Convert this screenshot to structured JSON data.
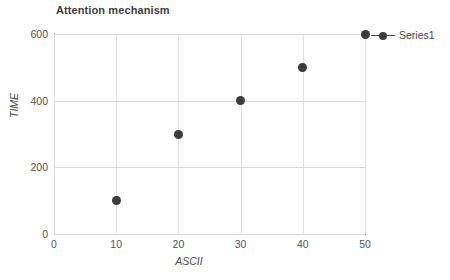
{
  "chart_data": {
    "type": "scatter",
    "title": "Attention mechanism",
    "xlabel": "ASCII",
    "ylabel": "TIME",
    "xlim": [
      0,
      50
    ],
    "ylim": [
      0,
      600
    ],
    "xticks": [
      "0",
      "10",
      "20",
      "30",
      "40",
      "50"
    ],
    "yticks": [
      "0",
      "200",
      "400",
      "600"
    ],
    "grid": true,
    "legend_position": "right",
    "marker_color": "#3c3c3c",
    "grid_color": "#d8d8d8",
    "axis_color": "#8d8d8d",
    "series": [
      {
        "name": "Series1",
        "x": [
          10,
          20,
          30,
          40,
          50
        ],
        "values": [
          100,
          300,
          400,
          500,
          600
        ]
      }
    ]
  },
  "legend": {
    "entries": [
      {
        "label": "Series1"
      }
    ]
  }
}
